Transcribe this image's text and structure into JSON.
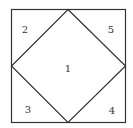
{
  "diagram": {
    "type": "square-with-inscribed-diamond",
    "stroke_color": "#333333",
    "regions": [
      {
        "label": "1",
        "x": 68,
        "y": 69
      },
      {
        "label": "2",
        "x": 25,
        "y": 30
      },
      {
        "label": "5",
        "x": 111,
        "y": 30
      },
      {
        "label": "3",
        "x": 28,
        "y": 110
      },
      {
        "label": "4",
        "x": 112,
        "y": 111
      }
    ]
  }
}
